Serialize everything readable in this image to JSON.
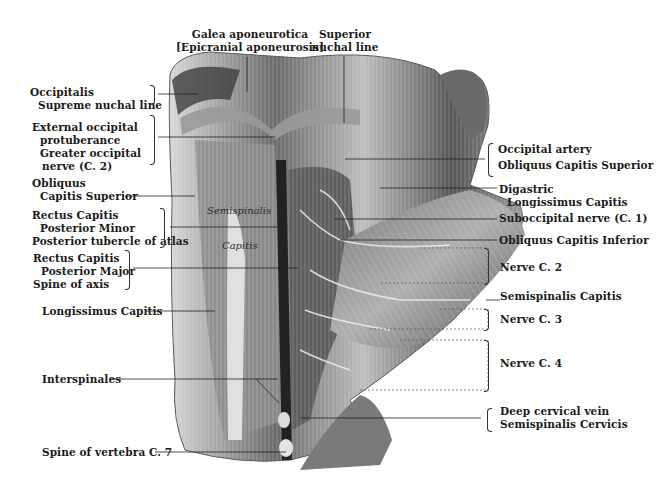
{
  "top_labels": {
    "galea": [
      "Galea aponeurotica",
      "[Epicranial aponeurosis]"
    ],
    "superior_nuchal": [
      "Superior",
      "nuchal line"
    ]
  },
  "left_labels": {
    "occipitalis": [
      "Occipitalis",
      "Supreme nuchal line"
    ],
    "ext_occipital": [
      "External occipital",
      "protuberance",
      "Greater occipital",
      "nerve (C. 2)"
    ],
    "obliquus_sup": [
      "Obliquus",
      "Capitis Superior"
    ],
    "rectus_minor": [
      "Rectus Capitis",
      "Posterior Minor",
      "Posterior tubercle of atlas"
    ],
    "rectus_major": [
      "Rectus Capitis",
      "Posterior Major",
      "Spine of axis"
    ],
    "longissimus": "Longissimus Capitis",
    "interspinales": "Interspinales",
    "spine_c7": "Spine of vertebra C. 7"
  },
  "right_labels": {
    "occipital_artery": [
      "Occipital artery",
      "Obliquus Capitis Superior"
    ],
    "digastric": [
      "Digastric",
      "Longissimus Capitis"
    ],
    "suboccipital_nerve": "Suboccipital nerve (C. 1)",
    "obliquus_inf": "Obliquus Capitis  Inferior",
    "nerve_c2": "Nerve C. 2",
    "semispinalis_capitis": "Semispinalis Capitis",
    "nerve_c3": "Nerve C. 3",
    "nerve_c4": "Nerve C. 4",
    "deep_cervical": [
      "Deep cervical vein",
      "Semispinalis Cervicis"
    ]
  },
  "in_image_labels": {
    "semispinalis": "Semispinalis",
    "capitis": "Capitis"
  },
  "colors": {
    "ink": "#1a1a1a",
    "muscle_dark": "#4a4a4a",
    "muscle_mid": "#8a8a8a",
    "muscle_light": "#c8c8c8"
  }
}
